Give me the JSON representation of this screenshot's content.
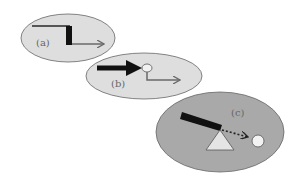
{
  "diagram": {
    "panels": [
      {
        "id": "a",
        "label": "(a)",
        "fill": "#dedede",
        "description": "step line with thick vertical drop, then thin arrow right"
      },
      {
        "id": "b",
        "label": "(b)",
        "fill": "#dedede",
        "description": "thick black arrow hits small circle, then thin bent arrow right"
      },
      {
        "id": "c",
        "label": "(c)",
        "fill": "#a9a9a9",
        "description": "tilted black bar on triangle fulcrum, dotted arrow to small circle"
      }
    ],
    "colors": {
      "outline": "#555555",
      "thick": "#111111",
      "thin_arrow": "#6a6a6a",
      "circle": "#f2f2f2",
      "triangle": "#e4e4e4"
    }
  }
}
